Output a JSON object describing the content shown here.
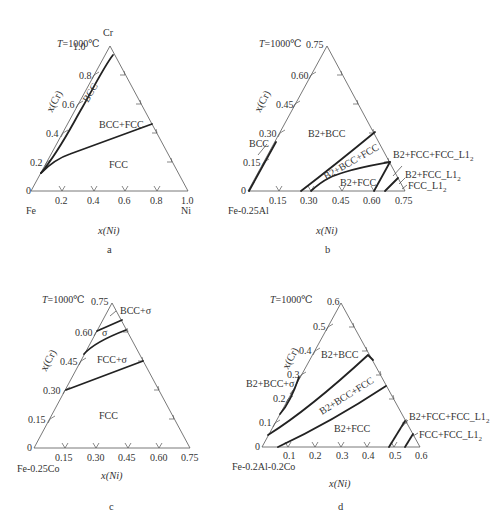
{
  "panels": [
    {
      "id": "a",
      "caption": "a",
      "temperature": "T=1000℃",
      "temp_italic": "T",
      "temp_rest": "=1000℃",
      "apex_label": "Cr",
      "left_label": "Fe",
      "right_label": "Ni",
      "y_axis": "x(Cr)",
      "x_axis": "x(Ni)",
      "left_ticks": [
        "0",
        "0.2",
        "0.4",
        "0.6",
        "0.8",
        "1.0"
      ],
      "bottom_ticks": [
        "0.2",
        "0.4",
        "0.6",
        "0.8",
        "1.0"
      ],
      "regions": [
        "BCC",
        "BCC+FCC",
        "FCC"
      ]
    },
    {
      "id": "b",
      "caption": "b",
      "temp_italic": "T",
      "temp_rest": "=1000℃",
      "left_label": "Fe-0.25Al",
      "y_axis": "x(Cr)",
      "x_axis": "x(Ni)",
      "left_ticks": [
        "0",
        "0.15",
        "0.30",
        "0.45",
        "0.60",
        "0.75"
      ],
      "bottom_ticks": [
        "0.15",
        "0.30",
        "0.45",
        "0.60",
        "0.75"
      ],
      "regions": [
        "BCC",
        "B2+BCC",
        "B2+BCC+FCC",
        "B2+FCC",
        "B2+FCC+FCC_L1",
        "B2+FCC_L1",
        "FCC_L1"
      ],
      "sub": "2"
    },
    {
      "id": "c",
      "caption": "c",
      "temp_italic": "T",
      "temp_rest": "=1000℃",
      "left_label": "Fe-0.25Co",
      "y_axis": "x(Cr)",
      "x_axis": "x(Ni)",
      "left_ticks": [
        "0",
        "0.15",
        "0.30",
        "0.45",
        "0.60",
        "0.75"
      ],
      "bottom_ticks": [
        "0.15",
        "0.30",
        "0.45",
        "0.60",
        "0.75"
      ],
      "regions": [
        "BCC+σ",
        "σ",
        "FCC+σ",
        "FCC"
      ]
    },
    {
      "id": "d",
      "caption": "d",
      "temp_italic": "T",
      "temp_rest": "=1000℃",
      "left_label": "Fe-0.2Al-0.2Co",
      "y_axis": "x(Cr)",
      "x_axis": "x(Ni)",
      "left_ticks": [
        "0",
        "0.1",
        "0.2",
        "0.3",
        "0.4",
        "0.5",
        "0.6"
      ],
      "bottom_ticks": [
        "0.1",
        "0.2",
        "0.3",
        "0.4",
        "0.5",
        "0.6"
      ],
      "regions": [
        "B2+BCC",
        "B2+BCC+σ",
        "B2+BCC+FCC",
        "B2+FCC",
        "B2+FCC+FCC_L1",
        "FCC+FCC_L1"
      ],
      "sub": "2"
    }
  ]
}
